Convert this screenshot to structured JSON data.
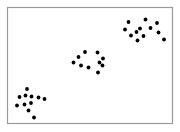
{
  "figure": {
    "background_color": "#ffffff",
    "width": 180,
    "height": 132
  },
  "frame": {
    "x": 7.5,
    "y": 7.5,
    "width": 165,
    "height": 116,
    "stroke_color": "#9a9a9a",
    "stroke_width": 1.2,
    "fill_color": "#ffffff"
  },
  "chart_data": {
    "type": "scatter",
    "title": "",
    "xlabel": "",
    "ylabel": "",
    "xlim": [
      0,
      100
    ],
    "ylim": [
      0,
      100
    ],
    "grid": false,
    "legend": false,
    "axis_ticks": false,
    "marker": {
      "shape": "circle",
      "color": "#000000",
      "radius_px": 1.9
    },
    "n_clusters": 3,
    "n_points": 33,
    "series": [
      {
        "name": "cluster-bottom-left",
        "color": "#000000",
        "n_points": 11,
        "points_px": [
          [
            27.0,
            89.0
          ],
          [
            19.5,
            97.0
          ],
          [
            25.5,
            95.5
          ],
          [
            31.5,
            96.5
          ],
          [
            38.5,
            97.5
          ],
          [
            44.5,
            99.0
          ],
          [
            17.0,
            105.5
          ],
          [
            24.5,
            104.5
          ],
          [
            31.0,
            103.0
          ],
          [
            28.5,
            110.5
          ],
          [
            34.0,
            117.5
          ]
        ],
        "points_data": [
          [
            12.1,
            29.3
          ],
          [
            7.3,
            22.4
          ],
          [
            11.2,
            23.7
          ],
          [
            15.0,
            22.8
          ],
          [
            19.6,
            21.9
          ],
          [
            23.4,
            20.7
          ],
          [
            5.8,
            15.5
          ],
          [
            10.6,
            16.4
          ],
          [
            14.8,
            17.7
          ],
          [
            13.2,
            11.2
          ],
          [
            16.7,
            5.2
          ]
        ]
      },
      {
        "name": "cluster-middle",
        "color": "#000000",
        "n_points": 10,
        "points_px": [
          [
            85.0,
            52.0
          ],
          [
            97.5,
            52.5
          ],
          [
            78.5,
            57.0
          ],
          [
            103.0,
            58.5
          ],
          [
            73.5,
            62.5
          ],
          [
            99.5,
            62.5
          ],
          [
            81.0,
            65.5
          ],
          [
            102.5,
            65.5
          ],
          [
            88.5,
            67.5
          ],
          [
            98.0,
            72.5
          ]
        ],
        "points_data": [
          [
            49.4,
            61.6
          ],
          [
            57.4,
            61.2
          ],
          [
            45.2,
            57.3
          ],
          [
            60.9,
            56.0
          ],
          [
            42.0,
            52.2
          ],
          [
            58.7,
            52.2
          ],
          [
            46.8,
            49.6
          ],
          [
            60.5,
            49.6
          ],
          [
            51.6,
            47.8
          ],
          [
            57.6,
            43.5
          ]
        ]
      },
      {
        "name": "cluster-top-right",
        "color": "#000000",
        "n_points": 12,
        "points_px": [
          [
            128.5,
            22.0
          ],
          [
            145.5,
            19.5
          ],
          [
            157.0,
            23.0
          ],
          [
            125.0,
            29.5
          ],
          [
            140.0,
            28.5
          ],
          [
            150.5,
            28.0
          ],
          [
            136.5,
            32.0
          ],
          [
            158.5,
            32.5
          ],
          [
            131.0,
            35.5
          ],
          [
            143.5,
            36.0
          ],
          [
            137.5,
            40.5
          ],
          [
            164.0,
            39.5
          ]
        ],
        "points_data": [
          [
            77.3,
            87.3
          ],
          [
            88.2,
            89.5
          ],
          [
            95.5,
            86.4
          ],
          [
            75.0,
            80.9
          ],
          [
            84.6,
            81.8
          ],
          [
            91.4,
            82.2
          ],
          [
            82.4,
            78.6
          ],
          [
            96.5,
            78.2
          ],
          [
            74.8,
            75.4
          ],
          [
            87.1,
            75.0
          ],
          [
            83.1,
            71.1
          ],
          [
            100.0,
            71.9
          ]
        ]
      }
    ]
  }
}
